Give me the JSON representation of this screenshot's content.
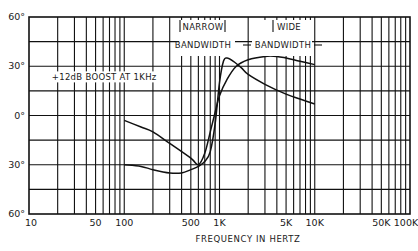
{
  "chart_data": {
    "type": "line",
    "title": "",
    "xlabel": "FREQUENCY IN HERTZ",
    "ylabel": "Phase (degrees)",
    "x_scale": "log",
    "xlim": [
      10,
      100000
    ],
    "ylim": [
      -60,
      60
    ],
    "grid": true,
    "x_tick_labels": [
      "10",
      "50",
      "100",
      "500",
      "1K",
      "5K",
      "10K",
      "50K",
      "100K"
    ],
    "x_tick_values": [
      10,
      50,
      100,
      500,
      1000,
      5000,
      10000,
      50000,
      100000
    ],
    "y_tick_labels": [
      "60°",
      "30°",
      "0°",
      "30°",
      "60°"
    ],
    "y_tick_values": [
      60,
      30,
      0,
      -30,
      -60
    ],
    "annotations": [
      {
        "text": "+12dB BOOST AT 1KHz",
        "x": 120,
        "y": 22
      },
      {
        "text": "NARROW",
        "x": 1000,
        "y": 48
      },
      {
        "text": "BANDWIDTH",
        "x": 1000,
        "y": 39
      },
      {
        "text": "WIDE",
        "x": 5000,
        "y": 48
      },
      {
        "text": "BANDWIDTH",
        "x": 5000,
        "y": 39
      }
    ],
    "series": [
      {
        "name": "Narrow Bandwidth",
        "x": [
          100,
          150,
          200,
          300,
          400,
          500,
          600,
          700,
          800,
          900,
          1000,
          1100,
          1200,
          1400,
          1700,
          2000,
          3000,
          5000,
          7000,
          10000
        ],
        "y": [
          -30,
          -31,
          -33,
          -35,
          -35,
          -33,
          -31,
          -28,
          -22,
          -5,
          20,
          33,
          35,
          33,
          29,
          25,
          19,
          13,
          10,
          7
        ]
      },
      {
        "name": "Wide Bandwidth",
        "x": [
          100,
          150,
          200,
          300,
          500,
          600,
          700,
          800,
          900,
          1000,
          1200,
          1500,
          2000,
          3000,
          4000,
          5000,
          7000,
          10000
        ],
        "y": [
          -3,
          -7,
          -10,
          -17,
          -26,
          -30,
          -23,
          -10,
          2,
          12,
          22,
          30,
          34,
          36,
          36,
          35,
          33,
          31
        ]
      }
    ]
  }
}
